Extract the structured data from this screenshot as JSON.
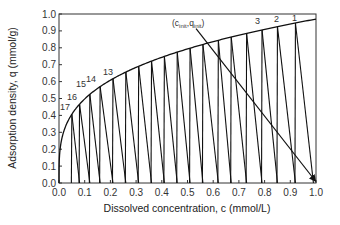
{
  "chart_data": {
    "type": "line",
    "title": "",
    "xlabel": "Dissolved concentration, c (mmol/L)",
    "ylabel": "Adsorption density, q (mmol/g)",
    "xlim": [
      0.0,
      1.0
    ],
    "ylim": [
      0.0,
      1.0
    ],
    "x_ticks": [
      "0.0",
      "0.1",
      "0.2",
      "0.3",
      "0.4",
      "0.5",
      "0.6",
      "0.7",
      "0.8",
      "0.9",
      "1.0"
    ],
    "y_ticks": [
      "0.0",
      "0.1",
      "0.2",
      "0.3",
      "0.4",
      "0.5",
      "0.6",
      "0.7",
      "0.8",
      "0.9",
      "1.0"
    ],
    "grid": false,
    "series": [
      {
        "name": "isotherm",
        "x": [
          0.0,
          0.01,
          0.02,
          0.05,
          0.1,
          0.2,
          0.3,
          0.4,
          0.5,
          0.6,
          0.7,
          0.8,
          0.9,
          1.0
        ],
        "y": [
          0.0,
          0.26,
          0.31,
          0.41,
          0.5,
          0.61,
          0.68,
          0.74,
          0.79,
          0.83,
          0.87,
          0.91,
          0.94,
          0.97
        ]
      },
      {
        "name": "stages",
        "stage_tops_c": [
          0.92,
          0.85,
          0.79,
          0.73,
          0.67,
          0.62,
          0.56,
          0.51,
          0.46,
          0.41,
          0.36,
          0.31,
          0.26,
          0.21,
          0.16,
          0.12,
          0.08,
          0.05
        ],
        "axis_points_c": [
          0.99,
          0.92,
          0.85,
          0.79,
          0.73,
          0.67,
          0.62,
          0.56,
          0.51,
          0.46,
          0.41,
          0.36,
          0.31,
          0.26,
          0.21,
          0.16,
          0.12,
          0.08
        ]
      },
      {
        "name": "operating line",
        "x": [
          0.58,
          0.99
        ],
        "y": [
          0.83,
          0.0
        ]
      }
    ],
    "stage_labels": [
      "1",
      "2",
      "3",
      "13",
      "14",
      "15",
      "16",
      "17"
    ],
    "annotations": [
      {
        "text": "(c",
        "sub1": "init",
        "mid": ",q",
        "sub2": "init",
        "end": ")",
        "x": 0.57,
        "y": 0.9
      }
    ]
  },
  "labels": {
    "xlabel": "Dissolved concentration, c (mmol/L)",
    "ylabel": "Adsorption density, q (mmol/g)",
    "annotation": {
      "open": "(c",
      "sub1": "init",
      "comma": ",q",
      "sub2": "init",
      "close": ")"
    },
    "stages": {
      "s1": "1",
      "s2": "2",
      "s3": "3",
      "s13": "13",
      "s14": "14",
      "s15": "15",
      "s16": "16",
      "s17": "17"
    }
  }
}
